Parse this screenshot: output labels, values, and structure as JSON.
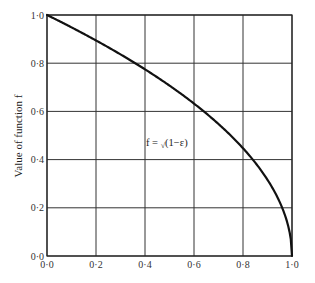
{
  "chart_data": {
    "type": "line",
    "title": "",
    "xlabel": "",
    "ylabel": "Value of function f",
    "xlim": [
      0.0,
      1.0
    ],
    "ylim": [
      0.0,
      1.0
    ],
    "grid": true,
    "x_ticks": [
      "0·0",
      "0·2",
      "0·4",
      "0·6",
      "0·8",
      "1·0"
    ],
    "y_ticks": [
      "0·0",
      "0·2",
      "0·4",
      "0·6",
      "0·8",
      "1·0"
    ],
    "annotation": "f = √(1−ε)",
    "series": [
      {
        "name": "f = √(1−ε)",
        "x": [
          0.0,
          0.1,
          0.2,
          0.3,
          0.4,
          0.5,
          0.6,
          0.7,
          0.8,
          0.9,
          0.95,
          0.98,
          1.0
        ],
        "y": [
          1.0,
          0.949,
          0.894,
          0.837,
          0.775,
          0.707,
          0.632,
          0.548,
          0.447,
          0.316,
          0.224,
          0.141,
          0.0
        ]
      }
    ]
  },
  "labels": {
    "ylabel": "Value of function f",
    "formula_prefix": "f = ",
    "formula_root": "√",
    "formula_body": "(1−ε)"
  }
}
